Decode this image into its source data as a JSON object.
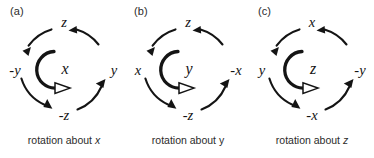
{
  "figure": {
    "background": "#ffffff",
    "ink_color": "#141414",
    "panel_count": 3
  },
  "panels": [
    {
      "id": "a",
      "label": "(a)",
      "caption_prefix": "rotation about ",
      "caption_axis": "x",
      "caption_axis_italic": true,
      "caption_full": "rotation about x",
      "center_label": "x",
      "ring_labels": {
        "top": "z",
        "right": "y",
        "bottom": "-z",
        "left": "-y"
      },
      "rotation_sense": "counter-clockwise",
      "outer_arrow_count": 4,
      "inner_arrow": {
        "glyph": "curl-arrow",
        "head_style": "hollow",
        "direction": "counter-clockwise"
      }
    },
    {
      "id": "b",
      "label": "(b)",
      "caption_prefix": "rotation about ",
      "caption_axis": "y",
      "caption_axis_italic": false,
      "caption_full": "rotation about y",
      "center_label": "y",
      "ring_labels": {
        "top": "z",
        "right": "-x",
        "bottom": "-z",
        "left": "x"
      },
      "rotation_sense": "counter-clockwise",
      "outer_arrow_count": 4,
      "inner_arrow": {
        "glyph": "curl-arrow",
        "head_style": "hollow",
        "direction": "counter-clockwise"
      }
    },
    {
      "id": "c",
      "label": "(c)",
      "caption_prefix": "rotation about ",
      "caption_axis": "z",
      "caption_axis_italic": true,
      "caption_full": "rotation about z",
      "center_label": "z",
      "ring_labels": {
        "top": "x",
        "right": "-y",
        "bottom": "-x",
        "left": "y"
      },
      "rotation_sense": "counter-clockwise",
      "outer_arrow_count": 4,
      "inner_arrow": {
        "glyph": "curl-arrow",
        "head_style": "hollow",
        "direction": "counter-clockwise"
      }
    }
  ]
}
